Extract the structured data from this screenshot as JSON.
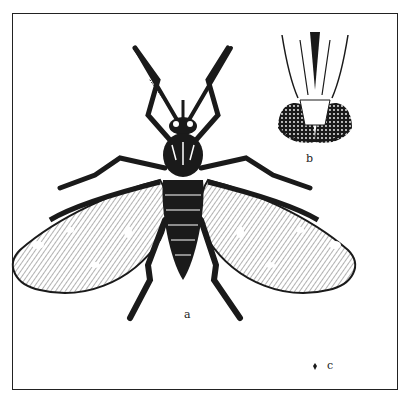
{
  "figure": {
    "labels": {
      "a": "a",
      "b": "b",
      "c": "c"
    },
    "panels": [
      {
        "id": "a",
        "content": "whole insect, dorsal view, wings spread"
      },
      {
        "id": "b",
        "content": "head detail, frontal view with compound eyes and mouthparts"
      },
      {
        "id": "c",
        "content": "natural size marker"
      }
    ],
    "colors": {
      "ink": "#1a1a1a",
      "paper": "#ffffff"
    }
  }
}
